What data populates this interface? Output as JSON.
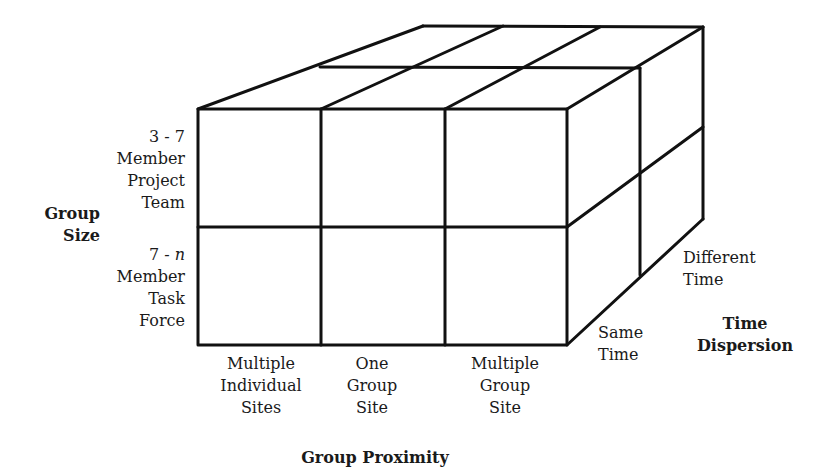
{
  "diagram": {
    "type": "3d-cube-matrix",
    "axes": {
      "group_size": {
        "title": [
          "Group",
          "Size"
        ],
        "levels": [
          {
            "lines": [
              "3 - 7",
              "Member",
              "Project",
              "Team"
            ]
          },
          {
            "lines_prefix": "7 - ",
            "lines_italic": "n",
            "lines": [
              "Member",
              "Task",
              "Force"
            ]
          }
        ]
      },
      "group_proximity": {
        "title": "Group Proximity",
        "levels": [
          {
            "lines": [
              "Multiple",
              "Individual",
              "Sites"
            ]
          },
          {
            "lines": [
              "One",
              "Group",
              "Site"
            ]
          },
          {
            "lines": [
              "Multiple",
              "Group",
              "Site"
            ]
          }
        ]
      },
      "time_dispersion": {
        "title": [
          "Time",
          "Dispersion"
        ],
        "levels": [
          {
            "lines": [
              "Same",
              "Time"
            ]
          },
          {
            "lines": [
              "Different",
              "Time"
            ]
          }
        ]
      }
    },
    "colors": {
      "line": "#111111",
      "background": "#ffffff",
      "text": "#1a1a1a"
    }
  }
}
